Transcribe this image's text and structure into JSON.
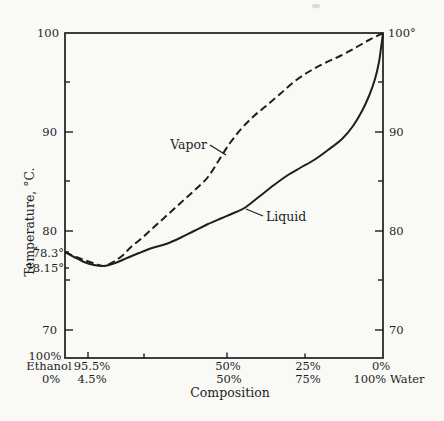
{
  "colors": {
    "background": "#f9f9f6",
    "ink": "#1e1e1e"
  },
  "labels": {
    "y_title": "Temperature, °C.",
    "x_title": "Composition",
    "vapor": "Vapor",
    "liquid": "Liquid",
    "left": {
      "t100": "100",
      "t90": "90",
      "t80": "80",
      "t70": "70",
      "azeo_top": "78.3°",
      "azeo_bottom": "78.15°"
    },
    "right": {
      "t100": "100°",
      "t90": "90",
      "t80": "80",
      "t70": "70"
    },
    "bottom": {
      "left_pct": "100%",
      "left_name": "Ethanol",
      "left_pct2": "0%",
      "azeo_ethanol": "95.5%",
      "azeo_water": "4.5%",
      "mid_ethanol": "50%",
      "mid_water": "50%",
      "quarter_ethanol": "25%",
      "quarter_water": "75%",
      "right_ethanol": "0%",
      "right_water": "100% Water"
    }
  },
  "chart_data": {
    "type": "line",
    "xlabel": "Composition",
    "ylabel": "Temperature, °C.",
    "x_axis": {
      "left_end": "100% ethanol / 0% water",
      "right_end": "0% ethanol / 100% water",
      "ticks_pct_ethanol": [
        100,
        95.5,
        75,
        50,
        25,
        0
      ]
    },
    "ylim": [
      67,
      100
    ],
    "y_ticks": [
      70,
      75,
      80,
      85,
      90,
      95,
      100
    ],
    "x_pct_ethanol": [
      100,
      95.5,
      90,
      80,
      70,
      60,
      50,
      40,
      30,
      20,
      10,
      0
    ],
    "series": [
      {
        "name": "Liquid",
        "line": "solid",
        "temps_c": [
          78.3,
          78.15,
          78.3,
          78.8,
          79.5,
          80.4,
          81.5,
          83.0,
          85.0,
          87.5,
          91.0,
          100
        ]
      },
      {
        "name": "Vapor",
        "line": "dashed",
        "temps_c": [
          78.3,
          78.15,
          78.7,
          80.3,
          82.2,
          84.5,
          87.0,
          89.8,
          92.7,
          95.5,
          98.0,
          100
        ]
      }
    ],
    "annotations": [
      "Pure ethanol boils at 78.3°",
      "Azeotrope: 95.5% ethanol / 4.5% water boils at 78.15°",
      "Pure water boils at 100°"
    ],
    "legend": "curve labels drawn on plot with leader lines",
    "grid": false,
    "pixel_geometry": {
      "plot_box": {
        "x": 65,
        "y": 33,
        "width": 318,
        "height": 325
      },
      "liquid_px": [
        [
          65,
          252
        ],
        [
          74,
          257
        ],
        [
          84,
          262
        ],
        [
          94,
          265
        ],
        [
          104,
          266
        ],
        [
          115,
          263
        ],
        [
          127,
          258
        ],
        [
          139,
          253
        ],
        [
          152,
          248
        ],
        [
          166,
          244
        ],
        [
          180,
          238
        ],
        [
          194,
          231
        ],
        [
          208,
          224
        ],
        [
          222,
          218
        ],
        [
          236,
          212
        ],
        [
          246,
          207
        ],
        [
          260,
          196
        ],
        [
          274,
          185
        ],
        [
          288,
          175
        ],
        [
          300,
          168
        ],
        [
          314,
          160
        ],
        [
          328,
          150
        ],
        [
          342,
          139
        ],
        [
          353,
          126
        ],
        [
          362,
          111
        ],
        [
          369,
          96
        ],
        [
          375,
          79
        ],
        [
          379,
          62
        ],
        [
          381,
          48
        ],
        [
          383,
          33
        ]
      ],
      "vapor_px": [
        [
          65,
          252
        ],
        [
          76,
          257
        ],
        [
          87,
          261
        ],
        [
          96,
          264
        ],
        [
          104,
          266
        ],
        [
          113,
          262
        ],
        [
          122,
          256
        ],
        [
          131,
          247
        ],
        [
          142,
          238
        ],
        [
          153,
          228
        ],
        [
          164,
          218
        ],
        [
          175,
          208
        ],
        [
          186,
          198
        ],
        [
          197,
          188
        ],
        [
          208,
          177
        ],
        [
          219,
          160
        ],
        [
          230,
          143
        ],
        [
          242,
          128
        ],
        [
          254,
          116
        ],
        [
          266,
          106
        ],
        [
          280,
          94
        ],
        [
          295,
          81
        ],
        [
          310,
          71
        ],
        [
          325,
          63
        ],
        [
          340,
          56
        ],
        [
          355,
          48
        ],
        [
          369,
          40
        ],
        [
          383,
          33
        ]
      ]
    }
  }
}
